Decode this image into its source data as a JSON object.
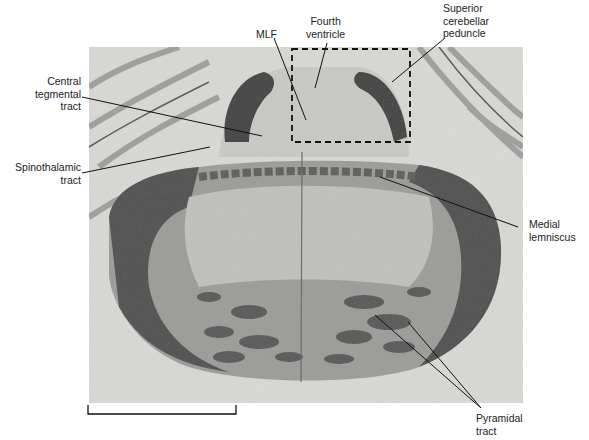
{
  "figure": {
    "labels": [
      {
        "id": "mlf",
        "lines": [
          "MLF"
        ]
      },
      {
        "id": "fourth-ventricle",
        "lines": [
          "Fourth",
          "ventricle"
        ]
      },
      {
        "id": "superior-cerebellar-peduncle",
        "lines": [
          "Superior",
          "cerebellar",
          "peduncle"
        ]
      },
      {
        "id": "central-tegmental-tract",
        "lines": [
          "Central",
          "tegmental",
          "tract"
        ]
      },
      {
        "id": "spinothalamic-tract",
        "lines": [
          "Spinothalamic",
          "tract"
        ]
      },
      {
        "id": "medial-lemniscus",
        "lines": [
          "Medial",
          "lemniscus"
        ]
      },
      {
        "id": "pyramidal-tract",
        "lines": [
          "Pyramidal",
          "tract"
        ]
      }
    ],
    "inset_box": {
      "style": "dashed",
      "region": "fourth ventricle and MLF"
    },
    "scale_bar": {
      "visible": true
    }
  },
  "colors": {
    "background": "#d9d9d6",
    "tissue_dark": "#4a4a4a",
    "tissue_mid": "#8a8a88",
    "tissue_light": "#c8c8c5",
    "label_text": "#222222",
    "leader_line": "#111111"
  }
}
